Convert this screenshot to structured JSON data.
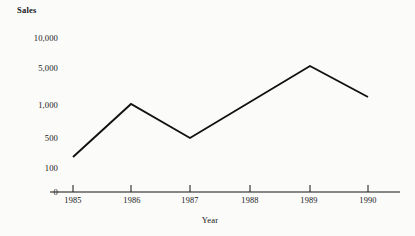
{
  "chart_data": {
    "type": "line",
    "title": "",
    "ylabel": "Sales",
    "xlabel": "Year",
    "categories": [
      "1985",
      "1986",
      "1987",
      "1988",
      "1989",
      "1990"
    ],
    "x": [
      1985,
      1986,
      1987,
      1988,
      1989,
      1990
    ],
    "values": [
      200,
      1000,
      500,
      2500,
      6000,
      2000
    ],
    "y_tick_labels": [
      "10,000",
      "5,000",
      "1,000",
      "500",
      "100",
      "0"
    ],
    "y_tick_values": [
      10000,
      5000,
      1000,
      500,
      100,
      0
    ],
    "x_tick_labels": [
      "1985",
      "1986",
      "1987",
      "1988",
      "1989",
      "1990"
    ],
    "grid": false,
    "legend": "none",
    "axis_style": "x-axis-line-only",
    "line_color": "#111111",
    "background_color": "#fbfbf9",
    "series": [
      {
        "name": "Sales",
        "values": [
          200,
          1000,
          500,
          2500,
          6000,
          2000
        ]
      }
    ],
    "points_px": [
      {
        "label": "1985",
        "x": 73,
        "y": 157
      },
      {
        "label": "1986",
        "x": 131,
        "y": 104
      },
      {
        "label": "1987",
        "x": 190,
        "y": 138
      },
      {
        "label": "1988",
        "x": 250,
        "y": 121
      },
      {
        "label": "1989",
        "x": 310,
        "y": 66
      },
      {
        "label": "1990",
        "x": 368,
        "y": 97
      }
    ]
  },
  "axes": {
    "y_title": "Sales",
    "x_title": "Year",
    "y_labels": [
      {
        "text": "10,000",
        "top": 34
      },
      {
        "text": "5,000",
        "top": 64
      },
      {
        "text": "1,000",
        "top": 101
      },
      {
        "text": "500",
        "top": 134
      },
      {
        "text": "100",
        "top": 164
      },
      {
        "text": "0",
        "top": 188
      }
    ],
    "x_labels": [
      {
        "text": "1985",
        "left": 45
      },
      {
        "text": "1986",
        "left": 104
      },
      {
        "text": "1987",
        "left": 162
      },
      {
        "text": "1988",
        "left": 222
      },
      {
        "text": "1989",
        "left": 281
      },
      {
        "text": "1990",
        "left": 340
      }
    ]
  }
}
